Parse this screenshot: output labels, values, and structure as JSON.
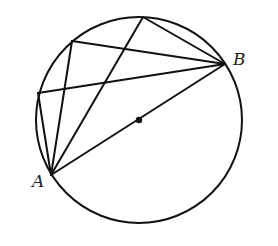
{
  "diagram": {
    "colors": {
      "stroke": "#111111",
      "background": "#ffffff",
      "label": "#222222"
    },
    "circle": {
      "cx": 139,
      "cy": 120,
      "r": 103
    },
    "center": {
      "x": 139,
      "y": 120,
      "r": 3.2
    },
    "points": {
      "A": {
        "x": 51,
        "y": 175,
        "label": "A",
        "label_x": 32,
        "label_y": 187
      },
      "B": {
        "x": 225,
        "y": 64,
        "label": "B",
        "label_x": 233,
        "label_y": 65
      },
      "P1": {
        "x": 38,
        "y": 93
      },
      "P2": {
        "x": 72,
        "y": 41
      },
      "P3": {
        "x": 143,
        "y": 17
      }
    },
    "segments": [
      [
        "A",
        "B"
      ],
      [
        "A",
        "P1"
      ],
      [
        "P1",
        "B"
      ],
      [
        "A",
        "P2"
      ],
      [
        "P2",
        "B"
      ],
      [
        "A",
        "P3"
      ],
      [
        "P3",
        "B"
      ]
    ]
  }
}
